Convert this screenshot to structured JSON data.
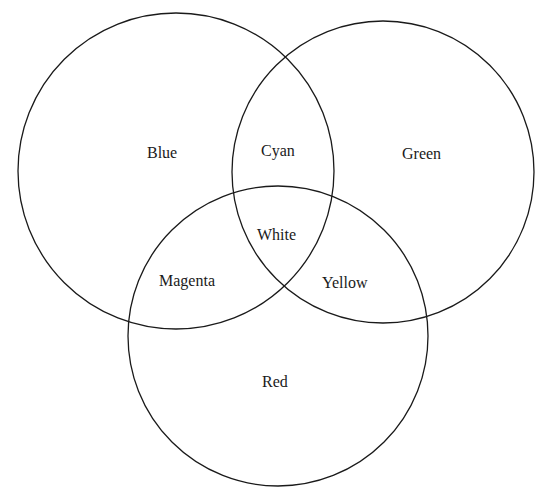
{
  "diagram": {
    "type": "venn",
    "stroke_color": "#1a1a1a",
    "background": "#ffffff",
    "sets": [
      {
        "id": "blue",
        "label": "Blue",
        "cx": 176,
        "cy": 171,
        "r": 158
      },
      {
        "id": "green",
        "label": "Green",
        "cx": 383,
        "cy": 172,
        "r": 151
      },
      {
        "id": "red",
        "label": "Red",
        "cx": 278,
        "cy": 336,
        "r": 158
      }
    ],
    "regions": {
      "blue": "Blue",
      "green": "Green",
      "red": "Red",
      "cyan": "Cyan",
      "magenta": "Magenta",
      "yellow": "Yellow",
      "white": "White"
    }
  }
}
